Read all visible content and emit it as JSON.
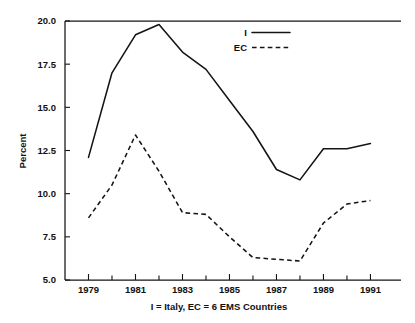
{
  "chart_data": {
    "type": "line",
    "title": "",
    "subtitle": "I = Italy, EC = 6 EMS Countries",
    "xlabel": "",
    "ylabel": "Percent",
    "x": [
      1979,
      1980,
      1981,
      1982,
      1983,
      1984,
      1985,
      1986,
      1987,
      1988,
      1989,
      1990,
      1991
    ],
    "xlim": [
      1978.0,
      1992.3
    ],
    "ylim": [
      5.0,
      20.0
    ],
    "grid": false,
    "legend_position": "top-center-right",
    "x_tick_labels": [
      "1979",
      "1981",
      "1983",
      "1985",
      "1987",
      "1989",
      "1991"
    ],
    "x_major_ticks": [
      1979,
      1981,
      1983,
      1985,
      1987,
      1989,
      1991
    ],
    "x_minor_ticks": [
      1980,
      1982,
      1984,
      1986,
      1988,
      1990
    ],
    "y_tick_labels": [
      "5.0",
      "7.5",
      "10.0",
      "12.5",
      "15.0",
      "17.5",
      "20.0"
    ],
    "y_ticks": [
      5.0,
      7.5,
      10.0,
      12.5,
      15.0,
      17.5,
      20.0
    ],
    "series": [
      {
        "name": "I",
        "style": "solid",
        "color": "#141414",
        "values": [
          12.1,
          17.0,
          19.2,
          19.8,
          18.2,
          17.2,
          15.4,
          13.6,
          11.4,
          10.8,
          12.6,
          12.6,
          12.9
        ]
      },
      {
        "name": "EC",
        "style": "dashed",
        "color": "#141414",
        "values": [
          8.6,
          10.5,
          13.4,
          11.3,
          8.9,
          8.8,
          7.5,
          6.3,
          6.2,
          6.1,
          8.3,
          9.4,
          9.6
        ]
      }
    ]
  },
  "legend": {
    "entries": [
      {
        "label": "I",
        "style": "solid"
      },
      {
        "label": "EC",
        "style": "dashed"
      }
    ]
  },
  "axes": {
    "y_axis_title": "Percent"
  },
  "caption": {
    "text": "I = Italy, EC = 6 EMS Countries"
  }
}
